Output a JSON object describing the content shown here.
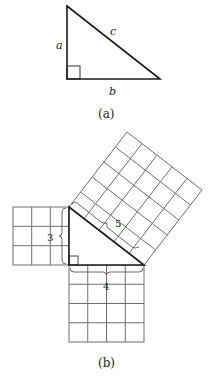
{
  "figure_a": {
    "caption": "(a)",
    "side_a_label": "a",
    "side_b_label": "b",
    "side_c_label": "c"
  },
  "figure_b": {
    "caption": "(b)",
    "side_3_label": "3",
    "side_4_label": "4",
    "side_5_label": "5",
    "square_small_grid": 3,
    "square_medium_grid": 4,
    "square_large_grid": 5
  },
  "colors": {
    "triangle_stroke": "#1a1a1a",
    "grid_stroke": "#6e6e6e"
  }
}
